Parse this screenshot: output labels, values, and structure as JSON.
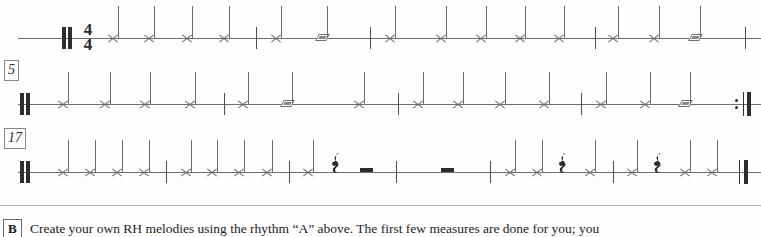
{
  "page": {
    "width": 761,
    "height": 237,
    "background": "#fefefe",
    "staff_color": "#6e6e70",
    "ink_color": "#2b2b2b"
  },
  "systems": [
    {
      "id": "system-1",
      "label": "",
      "y": 38,
      "start_barline": "thick-double",
      "time_signature": {
        "numerator": "4",
        "denominator": "4"
      },
      "end_barline": "none",
      "notes": [
        {
          "type": "x-note",
          "x": 113,
          "duration": "quarter"
        },
        {
          "type": "x-note",
          "x": 149,
          "duration": "quarter"
        },
        {
          "type": "x-note",
          "x": 187,
          "duration": "quarter"
        },
        {
          "type": "x-note",
          "x": 224,
          "duration": "quarter"
        },
        {
          "type": "x-note",
          "x": 276,
          "duration": "quarter"
        },
        {
          "type": "diamond-note",
          "x": 322,
          "duration": "half"
        },
        {
          "type": "x-note",
          "x": 390,
          "duration": "quarter"
        },
        {
          "type": "x-note",
          "x": 441,
          "duration": "quarter"
        },
        {
          "type": "x-note",
          "x": 481,
          "duration": "quarter"
        },
        {
          "type": "x-note",
          "x": 520,
          "duration": "quarter"
        },
        {
          "type": "x-note",
          "x": 559,
          "duration": "quarter"
        },
        {
          "type": "x-note",
          "x": 613,
          "duration": "quarter"
        },
        {
          "type": "x-note",
          "x": 654,
          "duration": "quarter"
        },
        {
          "type": "diamond-note",
          "x": 695,
          "duration": "half"
        }
      ],
      "barlines": [
        256,
        370,
        595,
        745
      ]
    },
    {
      "id": "system-2",
      "label": "5",
      "y": 104,
      "start_barline": "thick-double",
      "time_signature": null,
      "end_barline": "repeat-end",
      "notes": [
        {
          "type": "x-note",
          "x": 63,
          "duration": "quarter"
        },
        {
          "type": "x-note",
          "x": 105,
          "duration": "quarter"
        },
        {
          "type": "x-note",
          "x": 145,
          "duration": "quarter"
        },
        {
          "type": "x-note",
          "x": 190,
          "duration": "quarter"
        },
        {
          "type": "x-note",
          "x": 243,
          "duration": "quarter"
        },
        {
          "type": "diamond-note",
          "x": 287,
          "duration": "half"
        },
        {
          "type": "x-note",
          "x": 359,
          "duration": "quarter"
        },
        {
          "type": "x-note",
          "x": 418,
          "duration": "quarter"
        },
        {
          "type": "x-note",
          "x": 458,
          "duration": "quarter"
        },
        {
          "type": "x-note",
          "x": 500,
          "duration": "quarter"
        },
        {
          "type": "x-note",
          "x": 544,
          "duration": "quarter"
        },
        {
          "type": "x-note",
          "x": 601,
          "duration": "quarter"
        },
        {
          "type": "x-note",
          "x": 645,
          "duration": "quarter"
        },
        {
          "type": "diamond-note",
          "x": 685,
          "duration": "half"
        }
      ],
      "barlines": [
        224,
        398,
        581
      ]
    },
    {
      "id": "system-3",
      "label": "17",
      "y": 172,
      "start_barline": "thick-double",
      "time_signature": null,
      "end_barline": "final",
      "notes": [
        {
          "type": "x-note",
          "x": 63,
          "duration": "quarter"
        },
        {
          "type": "x-note",
          "x": 90,
          "duration": "quarter"
        },
        {
          "type": "x-note",
          "x": 117,
          "duration": "quarter"
        },
        {
          "type": "x-note",
          "x": 144,
          "duration": "quarter"
        },
        {
          "type": "x-note",
          "x": 186,
          "duration": "quarter"
        },
        {
          "type": "x-note",
          "x": 212,
          "duration": "quarter"
        },
        {
          "type": "x-note",
          "x": 239,
          "duration": "quarter"
        },
        {
          "type": "x-note",
          "x": 267,
          "duration": "quarter"
        },
        {
          "type": "x-note",
          "x": 308,
          "duration": "quarter"
        },
        {
          "type": "quarter-rest",
          "x": 335,
          "duration": "quarter"
        },
        {
          "type": "half-rest",
          "x": 366,
          "duration": "half"
        },
        {
          "type": "half-rest",
          "x": 447,
          "duration": "half"
        },
        {
          "type": "x-note",
          "x": 510,
          "duration": "quarter"
        },
        {
          "type": "x-note",
          "x": 537,
          "duration": "quarter"
        },
        {
          "type": "quarter-rest",
          "x": 562,
          "duration": "quarter"
        },
        {
          "type": "x-note",
          "x": 590,
          "duration": "quarter"
        },
        {
          "type": "x-note",
          "x": 632,
          "duration": "quarter"
        },
        {
          "type": "quarter-rest",
          "x": 657,
          "duration": "quarter"
        },
        {
          "type": "x-note",
          "x": 685,
          "duration": "quarter"
        },
        {
          "type": "x-note",
          "x": 712,
          "duration": "quarter"
        }
      ],
      "barlines": [
        166,
        289,
        396,
        490,
        613
      ]
    }
  ],
  "exercise": {
    "marker": "B",
    "text": "Create your own RH melodies using the rhythm “A” above. The first few measures are done for you; you"
  }
}
